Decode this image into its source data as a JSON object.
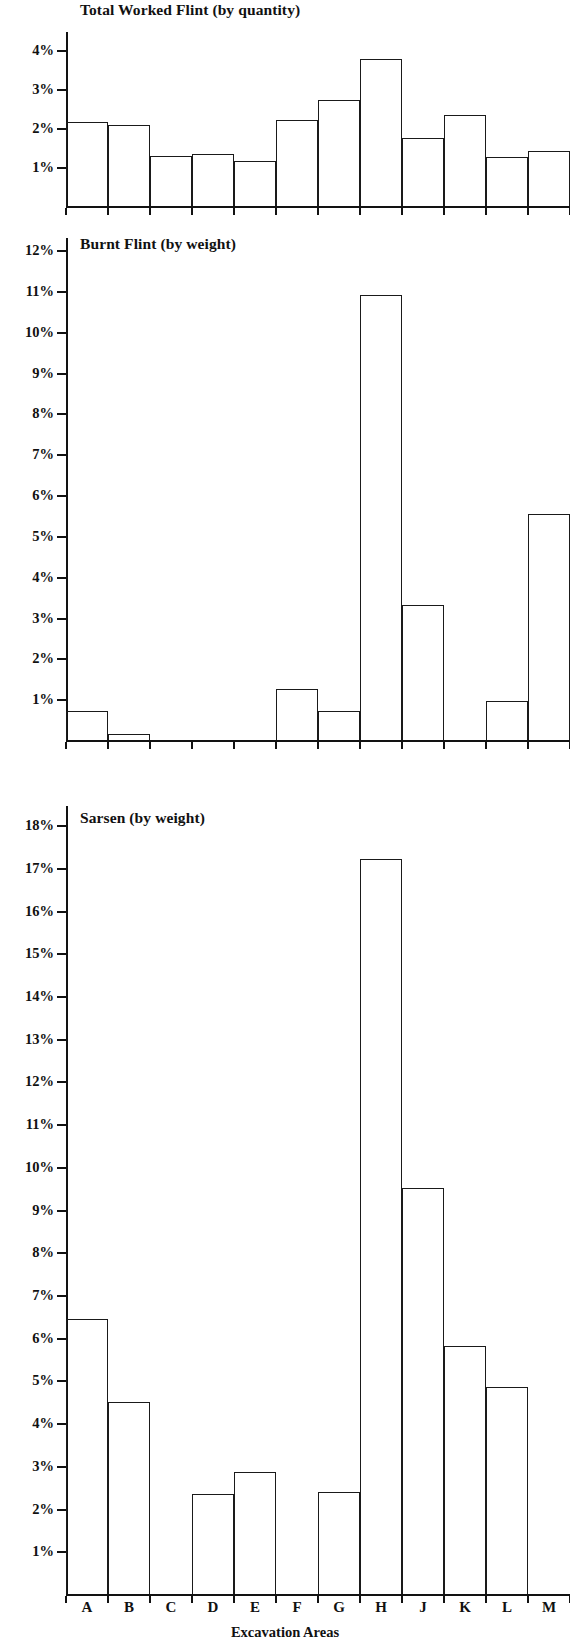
{
  "figure": {
    "x_axis_title": "Excavation Areas",
    "categories": [
      "A",
      "B",
      "C",
      "D",
      "E",
      "F",
      "G",
      "H",
      "J",
      "K",
      "L",
      "M"
    ]
  },
  "chart_data": [
    {
      "type": "bar",
      "title": "Total Worked Flint (by quantity)",
      "xlabel": "Excavation Areas",
      "ylabel": "",
      "categories": [
        "A",
        "B",
        "C",
        "D",
        "E",
        "F",
        "G",
        "H",
        "J",
        "K",
        "L",
        "M"
      ],
      "values": [
        2.15,
        2.08,
        1.28,
        1.33,
        1.15,
        2.2,
        2.7,
        3.75,
        1.75,
        2.32,
        1.25,
        1.4
      ],
      "ylim": [
        0,
        4.45
      ],
      "yticks": [
        1,
        2,
        3,
        4
      ],
      "ytick_labels": [
        "1%",
        "2%",
        "3%",
        "4%"
      ],
      "grid": false,
      "legend": "none"
    },
    {
      "type": "bar",
      "title": "Burnt Flint (by weight)",
      "xlabel": "Excavation Areas",
      "ylabel": "",
      "categories": [
        "A",
        "B",
        "C",
        "D",
        "E",
        "F",
        "G",
        "H",
        "J",
        "K",
        "L",
        "M"
      ],
      "values": [
        0.7,
        0.15,
        0.0,
        0.0,
        0.0,
        1.25,
        0.7,
        10.9,
        3.3,
        0.0,
        0.95,
        5.55
      ],
      "ylim": [
        0,
        12.3
      ],
      "yticks": [
        1,
        2,
        3,
        4,
        5,
        6,
        7,
        8,
        9,
        10,
        11,
        12
      ],
      "ytick_labels": [
        "1%",
        "2%",
        "3%",
        "4%",
        "5%",
        "6%",
        "7%",
        "8%",
        "9%",
        "10%",
        "11%",
        "12%"
      ],
      "grid": false,
      "legend": "none"
    },
    {
      "type": "bar",
      "title": "Sarsen (by weight)",
      "xlabel": "Excavation Areas",
      "ylabel": "",
      "categories": [
        "A",
        "B",
        "C",
        "D",
        "E",
        "F",
        "G",
        "H",
        "J",
        "K",
        "L",
        "M"
      ],
      "values": [
        6.45,
        4.5,
        0.0,
        2.35,
        2.85,
        0.0,
        2.4,
        17.2,
        9.5,
        5.8,
        4.85,
        0.0
      ],
      "ylim": [
        0,
        18.45
      ],
      "yticks": [
        1,
        2,
        3,
        4,
        5,
        6,
        7,
        8,
        9,
        10,
        11,
        12,
        13,
        14,
        15,
        16,
        17,
        18
      ],
      "ytick_labels": [
        "1%",
        "2%",
        "3%",
        "4%",
        "5%",
        "6%",
        "7%",
        "8%",
        "9%",
        "10%",
        "11%",
        "12%",
        "13%",
        "14%",
        "15%",
        "16%",
        "17%",
        "18%"
      ],
      "grid": false,
      "legend": "none"
    }
  ]
}
